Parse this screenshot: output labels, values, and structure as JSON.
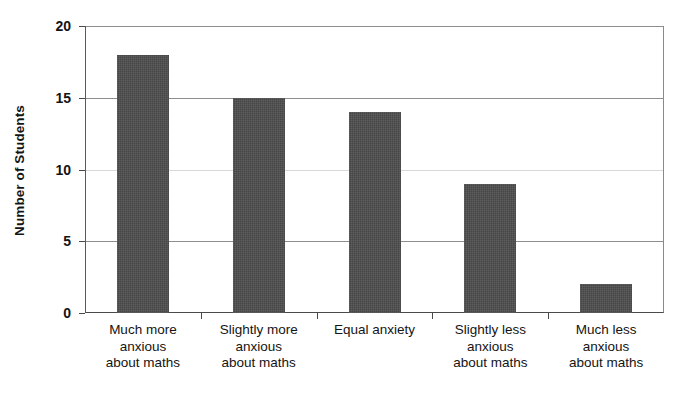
{
  "chart_data": {
    "type": "bar",
    "title": "",
    "subtitle": "",
    "xlabel": "",
    "ylabel": "Number of Students",
    "categories": [
      "Much more anxious about maths",
      "Slightly more anxious about maths",
      "Equal anxiety",
      "Slightly less anxious about maths",
      "Much less anxious about maths"
    ],
    "category_lines": [
      [
        "Much more",
        "anxious",
        "about maths"
      ],
      [
        "Slightly more",
        "anxious",
        "about maths"
      ],
      [
        "Equal anxiety"
      ],
      [
        "Slightly less",
        "anxious",
        "about maths"
      ],
      [
        "Much less",
        "anxious",
        "about maths"
      ]
    ],
    "values": [
      18,
      15,
      14,
      9,
      2
    ],
    "ylim": [
      0,
      20
    ],
    "ytick_values": [
      0,
      5,
      10,
      15,
      20
    ],
    "ytick_labels": [
      "0",
      "5",
      "10",
      "15",
      "20"
    ],
    "grid": true,
    "grid_axis": "y",
    "legend": false,
    "legend_position": "none",
    "bar_color": "#4d4d4d",
    "grid_color": "#8e8e8e",
    "axis_color": "#4a4a4a",
    "background_color": "#ffffff"
  }
}
